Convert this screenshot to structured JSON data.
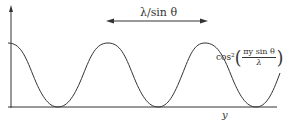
{
  "figure": {
    "period_label": "λ/sin θ",
    "formula": {
      "prefix": "cos²",
      "numerator": "πy sin θ",
      "denominator": "λ"
    },
    "x_axis_label": "y",
    "curve_color": "#333333",
    "axis_color": "#333333"
  }
}
